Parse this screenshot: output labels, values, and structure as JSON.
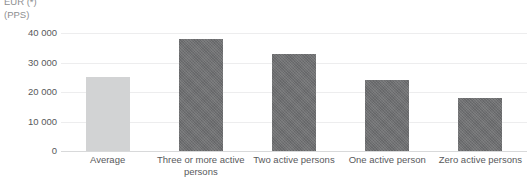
{
  "axis_title": {
    "line1": "EUR (*)",
    "line2": "(PPS)"
  },
  "chart_data": {
    "type": "bar",
    "title": "",
    "subtitle": "",
    "xlabel": "",
    "ylabel": "(PPS)",
    "ylim": [
      0,
      40000
    ],
    "grid": true,
    "legend": "none",
    "categories": [
      "Average",
      "Three or more active persons",
      "Two active persons",
      "One active person",
      "Zero active persons"
    ],
    "values": [
      25000,
      38000,
      33000,
      24000,
      18000
    ],
    "yticks": [
      40000,
      30000,
      20000,
      10000,
      0
    ],
    "ytick_labels": [
      "40 000",
      "30 000",
      "20 000",
      "10 000",
      "0"
    ],
    "bar_styles": [
      "light",
      "dark",
      "dark",
      "dark",
      "dark"
    ],
    "colors": {
      "bar_light": "#d2d3d4",
      "bar_dark": "#6e6f71",
      "gridline": "#ededee",
      "baseline": "#d8d9da",
      "text": "#58595b",
      "axis_title_text": "#8d8e90",
      "background": "#ffffff"
    }
  }
}
